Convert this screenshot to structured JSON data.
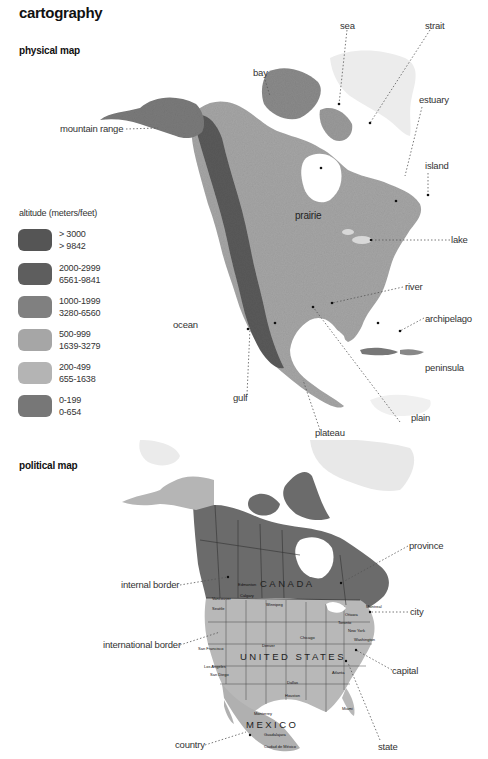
{
  "page": {
    "title": "cartography"
  },
  "physical_map": {
    "section_title": "physical map",
    "labels": {
      "sea": "sea",
      "strait": "strait",
      "bay": "bay",
      "estuary": "estuary",
      "mountain_range": "mountain range",
      "island": "island",
      "prairie": "prairie",
      "lake": "lake",
      "river": "river",
      "archipelago": "archipelago",
      "ocean": "ocean",
      "peninsula": "peninsula",
      "gulf": "gulf",
      "plain": "plain",
      "plateau": "plateau"
    },
    "legend": {
      "title": "altitude (meters/feet)",
      "items": [
        {
          "meters": "> 3000",
          "feet": "> 9842",
          "color": "#555555"
        },
        {
          "meters": "2000-2999",
          "feet": "6561-9841",
          "color": "#5e5e5e"
        },
        {
          "meters": "1000-1999",
          "feet": "3280-6560",
          "color": "#808080"
        },
        {
          "meters": "500-999",
          "feet": "1639-3279",
          "color": "#a6a6a6"
        },
        {
          "meters": "200-499",
          "feet": "655-1638",
          "color": "#b4b4b4"
        },
        {
          "meters": "0-199",
          "feet": "0-654",
          "color": "#777777"
        }
      ]
    }
  },
  "political_map": {
    "section_title": "political map",
    "labels": {
      "province": "province",
      "internal_border": "internal border",
      "city": "city",
      "international_border": "international border",
      "capital": "capital",
      "country": "country",
      "state": "state"
    },
    "countries": {
      "canada": "CANADA",
      "usa": "UNITED STATES",
      "mexico": "MEXICO"
    },
    "cities": {
      "edmonton": "Edmonton",
      "calgary": "Calgary",
      "vancouver": "Vancouver",
      "seattle": "Seattle",
      "winnipeg": "Winnipeg",
      "montreal": "Montreal",
      "ottawa": "Ottawa",
      "toronto": "Toronto",
      "new_york": "New York",
      "washington": "Washington",
      "chicago": "Chicago",
      "denver": "Denver",
      "san_francisco": "San Francisco",
      "los_angeles": "Los Angeles",
      "san_diego": "San Diego",
      "dallas": "Dallas",
      "houston": "Houston",
      "atlanta": "Atlanta",
      "miami": "Miami",
      "monterrey": "Monterrey",
      "guadalajara": "Guadalajara",
      "mexico_city": "Ciudad de México"
    },
    "colors": {
      "canada": "#6b6b6b",
      "usa": "#b8b8b8",
      "mexico": "#b0b0b0",
      "greenland": "#e6e6e6"
    }
  }
}
